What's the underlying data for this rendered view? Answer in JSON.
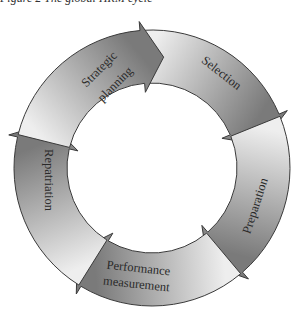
{
  "caption": "Figure 2 The global HRM cycle",
  "chart_data": {
    "type": "cycle",
    "title": "",
    "center": [
      152,
      168
    ],
    "outer_radius": 138,
    "inner_radius": 85,
    "direction": "clockwise",
    "stages": [
      {
        "name": "Strategic planning",
        "lines": [
          "Strategic",
          "planning"
        ],
        "start_angle": -162,
        "end_angle": -90
      },
      {
        "name": "Selection",
        "lines": [
          "Selection"
        ],
        "start_angle": -90,
        "end_angle": -18
      },
      {
        "name": "Preparation",
        "lines": [
          "Preparation"
        ],
        "start_angle": -18,
        "end_angle": 54
      },
      {
        "name": "Performance measurement",
        "lines": [
          "Performance",
          "measurement"
        ],
        "start_angle": 54,
        "end_angle": 126
      },
      {
        "name": "Repatriation",
        "lines": [
          "Repatriation"
        ],
        "start_angle": 126,
        "end_angle": 198
      }
    ],
    "colors": {
      "light": "#eeeeee",
      "dark": "#7a7a7a",
      "stroke": "#3a3a3a"
    }
  },
  "labels": {
    "strategic_1": "Strategic",
    "strategic_2": "planning",
    "selection": "Selection",
    "preparation": "Preparation",
    "performance_1": "Performance",
    "performance_2": "measurement",
    "repatriation": "Repatriation"
  }
}
